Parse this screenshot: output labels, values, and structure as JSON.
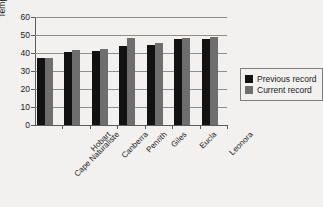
{
  "chart_data": {
    "type": "bar",
    "title": "",
    "xlabel": "",
    "ylabel": "Temperature (°C)",
    "ylim": [
      0,
      60
    ],
    "yticks": [
      0,
      10,
      20,
      30,
      40,
      50,
      60
    ],
    "grid": true,
    "legend_position": "right",
    "categories": [
      "Cape Naturaliste",
      "Hobart",
      "Canberra",
      "Penrith",
      "Giles",
      "Eucla",
      "Leonora"
    ],
    "series": [
      {
        "name": "Previous record",
        "color": "#121212",
        "values": [
          37,
          40.5,
          41,
          44,
          44.5,
          48,
          48
        ]
      },
      {
        "name": "Current record",
        "color": "#6e6e6e",
        "values": [
          37.5,
          41.5,
          42,
          48.5,
          45.5,
          48.5,
          49
        ]
      }
    ]
  },
  "legend": {
    "items": [
      {
        "label": "Previous record",
        "swatch": "prev"
      },
      {
        "label": "Current record",
        "swatch": "curr"
      }
    ]
  }
}
